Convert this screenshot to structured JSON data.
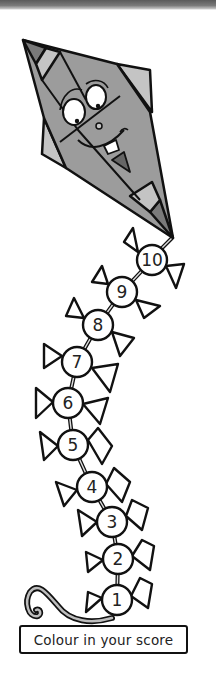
{
  "colors": {
    "kite_body": "#9c9c9c",
    "kite_tabs": "#c4c4c4",
    "kite_tips": "#7a7a7a",
    "outline": "#111111",
    "bead_fill": "#ffffff"
  },
  "beads": [
    {
      "label": "1"
    },
    {
      "label": "2"
    },
    {
      "label": "3"
    },
    {
      "label": "4"
    },
    {
      "label": "5"
    },
    {
      "label": "6"
    },
    {
      "label": "7"
    },
    {
      "label": "8"
    },
    {
      "label": "9"
    },
    {
      "label": "10"
    }
  ],
  "label": {
    "text": "Colour in your score"
  }
}
